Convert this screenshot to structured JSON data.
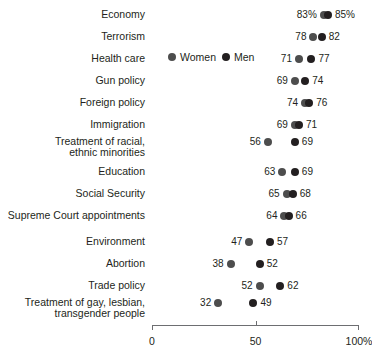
{
  "chart_data": {
    "type": "scatter",
    "title": "",
    "xlabel": "",
    "ylabel": "",
    "xlim": [
      0,
      100
    ],
    "grid": false,
    "legend_position": "inline-row-3",
    "axis_ticks": [
      {
        "value": 0,
        "label": "0"
      },
      {
        "value": 50,
        "label": "50"
      },
      {
        "value": 100,
        "label": "100%"
      }
    ],
    "series": [
      {
        "name": "Women",
        "color": "#4d4d4d"
      },
      {
        "name": "Men",
        "color": "#231f20"
      }
    ],
    "categories": [
      "Economy",
      "Terrorism",
      "Health care",
      "Gun policy",
      "Foreign policy",
      "Immigration",
      "Treatment of racial,\nethnic minorities",
      "Education",
      "Social Security",
      "Supreme Court appointments",
      "Environment",
      "Abortion",
      "Trade policy",
      "Treatment of gay, lesbian,\ntransgender people"
    ],
    "rows": [
      {
        "category": "Economy",
        "women": 83,
        "men": 85,
        "women_label": "83%",
        "men_label": "85%"
      },
      {
        "category": "Terrorism",
        "women": 78,
        "men": 82,
        "women_label": "78",
        "men_label": "82"
      },
      {
        "category": "Health care",
        "women": 71,
        "men": 77,
        "women_label": "71",
        "men_label": "77"
      },
      {
        "category": "Gun policy",
        "women": 69,
        "men": 74,
        "women_label": "69",
        "men_label": "74"
      },
      {
        "category": "Foreign policy",
        "women": 74,
        "men": 76,
        "women_label": "74",
        "men_label": "76"
      },
      {
        "category": "Immigration",
        "women": 69,
        "men": 71,
        "women_label": "69",
        "men_label": "71"
      },
      {
        "category": "Treatment of racial,\nethnic minorities",
        "women": 56,
        "men": 69,
        "women_label": "56",
        "men_label": "69"
      },
      {
        "category": "Education",
        "women": 63,
        "men": 69,
        "women_label": "63",
        "men_label": "69"
      },
      {
        "category": "Social Security",
        "women": 65,
        "men": 68,
        "women_label": "65",
        "men_label": "68"
      },
      {
        "category": "Supreme Court appointments",
        "women": 64,
        "men": 66,
        "women_label": "64",
        "men_label": "66"
      },
      {
        "category": "Environment",
        "women": 47,
        "men": 57,
        "women_label": "47",
        "men_label": "57"
      },
      {
        "category": "Abortion",
        "women": 38,
        "men": 52,
        "women_label": "38",
        "men_label": "52"
      },
      {
        "category": "Trade policy",
        "women": 52,
        "men": 62,
        "women_label": "52",
        "men_label": "62"
      },
      {
        "category": "Treatment of gay, lesbian,\ntransgender people",
        "women": 32,
        "men": 49,
        "women_label": "32",
        "men_label": "49"
      }
    ]
  },
  "legend": {
    "women": "Women",
    "men": "Men"
  }
}
